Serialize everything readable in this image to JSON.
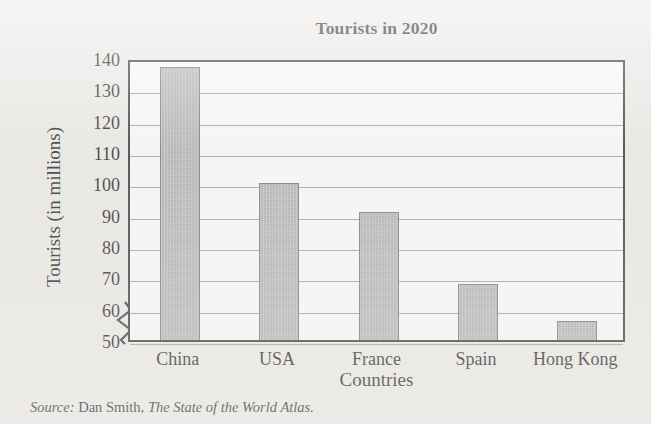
{
  "chart_data": {
    "type": "bar",
    "title": "Tourists in 2020",
    "xlabel": "Countries",
    "ylabel": "Tourists (in millions)",
    "categories": [
      "China",
      "USA",
      "France",
      "Spain",
      "Hong Kong"
    ],
    "values": [
      137,
      100,
      91,
      68,
      56
    ],
    "ylim": [
      50,
      140
    ],
    "yticks": [
      140,
      130,
      120,
      110,
      100,
      90,
      80,
      70,
      60,
      50
    ],
    "ytick_labels": [
      "140",
      "130",
      "120",
      "110",
      "100",
      "90",
      "80",
      "70",
      "60",
      "50"
    ],
    "y_axis_broken": true,
    "grid": true,
    "grid_axis": "y",
    "legend": "none",
    "bar_color": "#a9a9a9",
    "bar_edge_color": "#6d6d6d",
    "axis_color": "#2a2a2a",
    "plot_background": "#fbfbfa",
    "page_background": "#eceae7"
  },
  "source": {
    "label": "Source:",
    "author": " Dan Smith, ",
    "work": "The State of the World Atlas."
  },
  "icons": {
    "axis_break": "axis-break-zigzag-icon"
  }
}
